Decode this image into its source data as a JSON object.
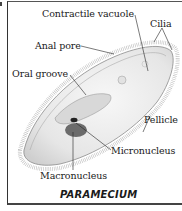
{
  "diagram": {
    "title": "PARAMECIUM",
    "labels": {
      "contractile_vacuole": "Contractile vacuole",
      "cilia": "Cilia",
      "anal_pore": "Anal pore",
      "oral_groove": "Oral groove",
      "pellicle": "Pellicle",
      "micronucleus": "Micronucleus",
      "macronucleus": "Macronucleus"
    },
    "colors": {
      "line": "#222222",
      "body_fill": "#eeeeee",
      "nucleus": "#555555",
      "frame": "#333333"
    }
  }
}
